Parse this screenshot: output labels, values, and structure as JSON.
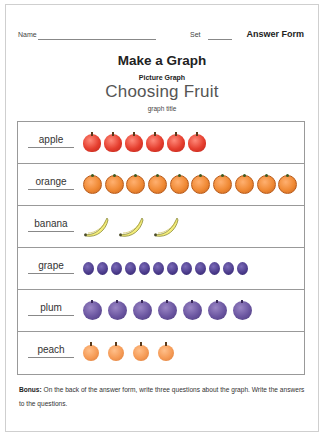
{
  "header": {
    "name_label": "Name",
    "set_label": "Set",
    "answer_form": "Answer Form"
  },
  "title": "Make a Graph",
  "subtitle": "Picture Graph",
  "graph_title": "Choosing Fruit",
  "graph_title_label": "graph title",
  "bonus": {
    "label": "Bonus:",
    "text": " On the back of the answer form, write three questions about the graph. Write the answers to the questions."
  },
  "colors": {
    "apple": "#e53e2e",
    "orange": "#f08a35",
    "banana": "#f3ec7a",
    "grape": "#4a3a8a",
    "plum": "#6a55a0",
    "peach": "#f59a55"
  },
  "chart_data": {
    "type": "picture graph",
    "title": "Choosing Fruit",
    "subtitle": "Picture Graph",
    "categories": [
      "apple",
      "orange",
      "banana",
      "grape",
      "plum",
      "peach"
    ],
    "values": [
      6,
      10,
      3,
      12,
      7,
      4
    ],
    "xlabel": "",
    "ylabel": "",
    "grid": false,
    "legend": "none"
  }
}
